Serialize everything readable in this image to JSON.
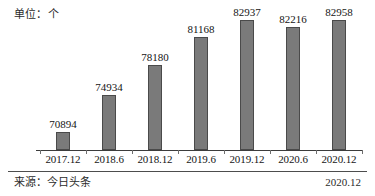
{
  "unit_label": "单位：个",
  "footer": {
    "source": "来源：今日头条",
    "date": "2020.12"
  },
  "chart_data": {
    "type": "bar",
    "title": "",
    "subtitle": "",
    "xlabel": "",
    "ylabel": "单位：个",
    "categories": [
      "2017.12",
      "2018.6",
      "2018.12",
      "2019.6",
      "2019.12",
      "2020.6",
      "2020.12"
    ],
    "values": [
      70894,
      74934,
      78180,
      81168,
      82937,
      82216,
      82958
    ],
    "value_labels": [
      "70894",
      "74934",
      "78180",
      "81168",
      "82937",
      "82216",
      "82958"
    ],
    "ylim": [
      69000,
      83600
    ],
    "grid": false,
    "legend": null,
    "bar_color": "#7a7a7a",
    "bar_edge_color": "#4a4a4a",
    "axis_color": "#3c3c3c"
  }
}
